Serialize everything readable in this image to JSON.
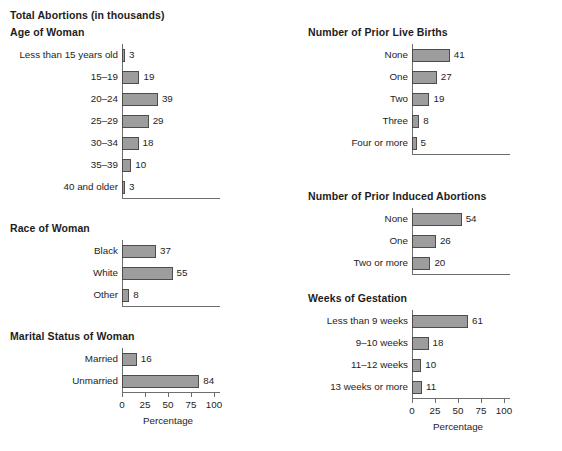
{
  "title": "Total Abortions (in thousands)",
  "axis": {
    "title": "Percentage",
    "ticks": [
      "0",
      "25",
      "50",
      "75",
      "100"
    ],
    "tick_values": [
      0,
      25,
      50,
      75,
      100
    ],
    "min": 0,
    "max": 100
  },
  "colors": {
    "bar_fill": "#9d9d9d",
    "bar_border": "#4c4c4c",
    "axis": "#6e6e6e",
    "text": "#1d1d1d",
    "background": "#ffffff"
  },
  "panels": [
    {
      "id": "age-of-woman",
      "title": "Age of Woman",
      "categories": [
        "Less than 15 years old",
        "15–19",
        "20–24",
        "25–29",
        "30–34",
        "35–39",
        "40 and older"
      ],
      "values": [
        3,
        19,
        39,
        29,
        18,
        10,
        3
      ],
      "labels": [
        "3",
        "19",
        "39",
        "29",
        "18",
        "10",
        "3"
      ]
    },
    {
      "id": "race-of-woman",
      "title": "Race of Woman",
      "categories": [
        "Black",
        "White",
        "Other"
      ],
      "values": [
        37,
        55,
        8
      ],
      "labels": [
        "37",
        "55",
        "8"
      ]
    },
    {
      "id": "marital-status-of-woman",
      "title": "Marital Status of Woman",
      "categories": [
        "Married",
        "Unmarried"
      ],
      "values": [
        16,
        84
      ],
      "labels": [
        "16",
        "84"
      ]
    },
    {
      "id": "number-of-prior-live-births",
      "title": "Number of Prior Live Births",
      "categories": [
        "None",
        "One",
        "Two",
        "Three",
        "Four or more"
      ],
      "values": [
        41,
        27,
        19,
        8,
        5
      ],
      "labels": [
        "41",
        "27",
        "19",
        "8",
        "5"
      ]
    },
    {
      "id": "number-of-prior-induced-abortions",
      "title": "Number of Prior Induced Abortions",
      "categories": [
        "None",
        "One",
        "Two or more"
      ],
      "values": [
        54,
        26,
        20
      ],
      "labels": [
        "54",
        "26",
        "20"
      ]
    },
    {
      "id": "weeks-of-gestation",
      "title": "Weeks of Gestation",
      "categories": [
        "Less than 9 weeks",
        "9–10 weeks",
        "11–12 weeks",
        "13 weeks or more"
      ],
      "values": [
        61,
        18,
        10,
        11
      ],
      "labels": [
        "61",
        "18",
        "10",
        "11"
      ]
    }
  ],
  "chart_data": {
    "type": "bar",
    "title": "Total Abortions (in thousands)",
    "xlabel": "Percentage",
    "ylabel": "",
    "xlim": [
      0,
      100
    ],
    "grid": false,
    "legend": "none",
    "orientation": "horizontal",
    "xticks": [
      0,
      25,
      50,
      75,
      100
    ],
    "panels": [
      {
        "title": "Age of Woman",
        "categories": [
          "Less than 15 years old",
          "15–19",
          "20–24",
          "25–29",
          "30–34",
          "35–39",
          "40 and older"
        ],
        "values": [
          3,
          19,
          39,
          29,
          18,
          10,
          3
        ]
      },
      {
        "title": "Race of Woman",
        "categories": [
          "Black",
          "White",
          "Other"
        ],
        "values": [
          37,
          55,
          8
        ]
      },
      {
        "title": "Marital Status of Woman",
        "categories": [
          "Married",
          "Unmarried"
        ],
        "values": [
          16,
          84
        ]
      },
      {
        "title": "Number of Prior Live Births",
        "categories": [
          "None",
          "One",
          "Two",
          "Three",
          "Four or more"
        ],
        "values": [
          41,
          27,
          19,
          8,
          5
        ]
      },
      {
        "title": "Number of Prior Induced Abortions",
        "categories": [
          "None",
          "One",
          "Two or more"
        ],
        "values": [
          54,
          26,
          20
        ]
      },
      {
        "title": "Weeks of Gestation",
        "categories": [
          "Less than 9 weeks",
          "9–10 weeks",
          "11–12 weeks",
          "13 weeks or more"
        ],
        "values": [
          61,
          18,
          10,
          11
        ]
      }
    ]
  }
}
